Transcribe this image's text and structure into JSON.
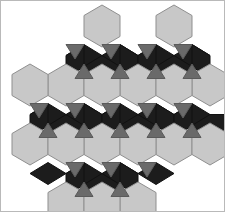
{
  "figure": {
    "width": 225,
    "height": 212,
    "background_color": "#ffffff",
    "border_color": "#b9b9b9"
  },
  "palette": {
    "hexagon_fill": "#c8c8c8",
    "hexagon_stroke": "#8f8f8f",
    "rhombus_fill": "#1c1c1c",
    "rhombus_stroke": "#111111",
    "triangle_fill": "#6a6a6a",
    "triangle_stroke": "#5a5a5a",
    "background": "#ffffff"
  },
  "geometry": {
    "hexagon_circumradius": 21,
    "hexagon_orientation": "pointy-top",
    "column_spacing": 36,
    "row_spacing": 59.5,
    "origin_x": 102,
    "origin_y": 26
  },
  "tiling": {
    "hexagon_count": 19,
    "rhombus_count": 42,
    "triangle_count": 24,
    "hexagon_centers": [
      [
        102,
        26
      ],
      [
        174,
        26
      ],
      [
        66,
        85
      ],
      [
        138,
        85
      ],
      [
        210,
        85
      ],
      [
        30,
        144
      ],
      [
        102,
        144
      ],
      [
        174,
        144
      ],
      [
        66,
        203
      ],
      [
        138,
        203
      ],
      [
        30,
        26
      ],
      [
        210,
        26
      ],
      [
        102,
        85
      ],
      [
        174,
        85
      ],
      [
        66,
        144
      ],
      [
        138,
        144
      ],
      [
        102,
        203
      ],
      [
        30,
        85
      ],
      [
        210,
        144
      ]
    ],
    "legend": [
      {
        "name": "hexagon",
        "label": "Hexagon tile",
        "color": "#c8c8c8"
      },
      {
        "name": "rhombus",
        "label": "Rhombus tile",
        "color": "#1c1c1c"
      },
      {
        "name": "triangle",
        "label": "Triangle tile",
        "color": "#6a6a6a"
      }
    ]
  }
}
